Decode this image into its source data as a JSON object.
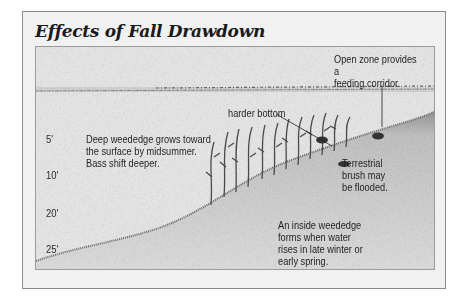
{
  "title": "Effects of Fall Drawdown",
  "depth_markers": [
    {
      "label": "5'"
    },
    {
      "label": "10'"
    },
    {
      "label": "20'"
    },
    {
      "label": "25'"
    }
  ],
  "annotations": {
    "open_zone": [
      "Open zone provides a",
      "feeding corridor."
    ],
    "harder_bottom": "harder bottom",
    "deep_weededge": [
      "Deep weededge grows toward",
      "the surface by midsummer.",
      "Bass shift deeper."
    ],
    "terrestrial": [
      "Terrestrial",
      "brush may",
      "be flooded."
    ],
    "inside_weededge": [
      "An inside weededge",
      "forms when water",
      "rises in late winter or",
      "early spring."
    ]
  },
  "colors": {
    "panel_bg": "#f1f1f1",
    "frame_bg": "#e9e9e9",
    "border": "#8a8a8a",
    "text": "#1e1e1e"
  }
}
